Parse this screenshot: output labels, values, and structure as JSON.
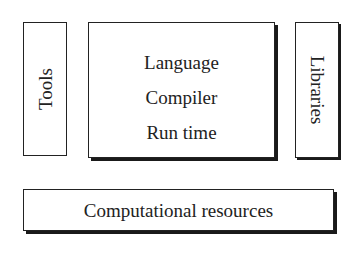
{
  "diagram": {
    "tools": {
      "label": "Tools",
      "orientation": "vertical-up"
    },
    "core": {
      "lines": [
        "Language",
        "Compiler",
        "Run time"
      ]
    },
    "libraries": {
      "label": "Libraries",
      "orientation": "vertical-down"
    },
    "resources": {
      "label": "Computational resources"
    }
  },
  "colors": {
    "stroke": "#222222",
    "background": "#ffffff",
    "text": "#222222"
  }
}
